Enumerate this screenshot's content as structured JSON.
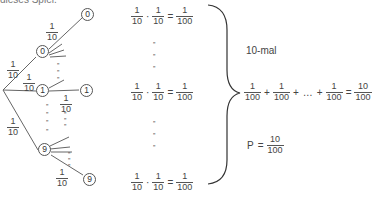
{
  "header_text_cut": "dieses Spiel.",
  "tree": {
    "edge_prob": {
      "num": "1",
      "den": "10"
    },
    "nodes": {
      "level1_top": "0",
      "level1_mid": "1",
      "level1_bot": "9",
      "level2_top": "0",
      "level2_mid": "1",
      "level2_bot": "9"
    },
    "ditto": "”"
  },
  "products": {
    "rows": [
      {
        "a": {
          "num": "1",
          "den": "10"
        },
        "op1": "·",
        "b": {
          "num": "1",
          "den": "10"
        },
        "op2": "=",
        "c": {
          "num": "1",
          "den": "100"
        }
      },
      {
        "a": {
          "num": "1",
          "den": "10"
        },
        "op1": "·",
        "b": {
          "num": "1",
          "den": "10"
        },
        "op2": "=",
        "c": {
          "num": "1",
          "den": "100"
        }
      },
      {
        "a": {
          "num": "1",
          "den": "10"
        },
        "op1": "·",
        "b": {
          "num": "1",
          "den": "10"
        },
        "op2": "=",
        "c": {
          "num": "1",
          "den": "100"
        }
      }
    ],
    "ditto": "”"
  },
  "summary": {
    "times_label": "10-mal",
    "sum": {
      "term": {
        "num": "1",
        "den": "100"
      },
      "plus": "+",
      "ellipsis": "…",
      "equals": "=",
      "result": {
        "num": "10",
        "den": "100"
      }
    },
    "probability": {
      "label": "P",
      "equals": "=",
      "result": {
        "num": "10",
        "den": "100"
      }
    }
  }
}
